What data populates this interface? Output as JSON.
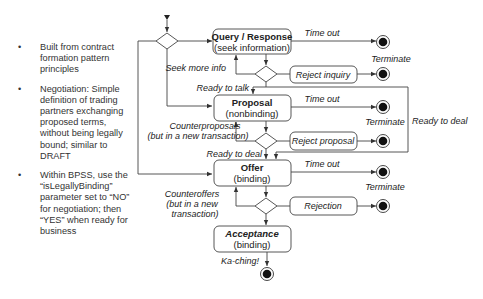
{
  "bullets": [
    {
      "text": "Built from contract formation pattern principles"
    },
    {
      "text": "Negotiation: Simple definition of trading partners exchanging proposed terms, without being legally bound; similar to DRAFT"
    },
    {
      "text": "Within BPSS, use the “isLegallyBinding” parameter set to “NO” for negotiation; then “YES” when ready for business"
    }
  ],
  "bullet_symbol": "•",
  "states": {
    "query": {
      "title": "Query / Response",
      "subtitle": "(seek information)"
    },
    "proposal": {
      "title": "Proposal",
      "subtitle": "(nonbinding)"
    },
    "offer": {
      "title": "Offer",
      "subtitle": "(binding)"
    },
    "acceptance": {
      "title": "Acceptance",
      "subtitle": "(binding)"
    }
  },
  "rejections": {
    "inquiry": "Reject inquiry",
    "proposal": "Reject proposal",
    "offer": "Rejection"
  },
  "labels": {
    "time_out": "Time out",
    "terminate": "Terminate",
    "seek_more_info": "Seek more info",
    "ready_to_talk": "Ready to talk",
    "ready_to_deal": "Ready to deal",
    "counterproposals_1": "Counterproposals",
    "counterproposals_2": "(but in a new transaction)",
    "counteroffers_1": "Counteroffers",
    "counteroffers_2": "(but in a new",
    "counteroffers_3": "transaction)",
    "ka_ching": "Ka-ching!"
  }
}
